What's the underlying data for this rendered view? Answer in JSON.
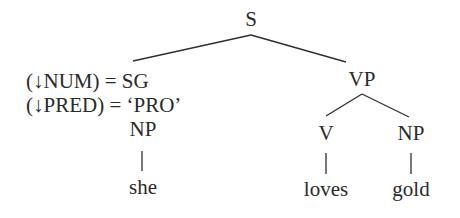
{
  "diagram": {
    "type": "syntax-tree",
    "nodes": {
      "root": "S",
      "subject_np": "NP",
      "vp": "VP",
      "verb": "V",
      "object_np": "NP"
    },
    "leaves": {
      "subject": "she",
      "verb": "loves",
      "object": "gold"
    },
    "annotations": [
      "(↓NUM) = SG",
      "(↓PRED) = ‘PRO’"
    ]
  }
}
